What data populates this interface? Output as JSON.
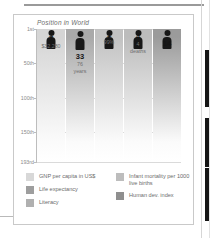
{
  "figure": {
    "title": "Position in World"
  },
  "chart_data": {
    "type": "bar",
    "title": "Position in World",
    "xlabel": "",
    "ylabel": "Position in World",
    "ylim": [
      1,
      193
    ],
    "grid": true,
    "legend_position": "bottom",
    "ytick_labels": [
      "1st",
      "50th",
      "100th",
      "150th",
      "193rd"
    ],
    "ytick_values": [
      1,
      50,
      100,
      150,
      193
    ],
    "categories": [
      "GNP per capita in US$",
      "Life expectancy",
      "Literacy",
      "Infant mortality per 1000 live births",
      "Human dev. index"
    ],
    "values": [
      7,
      33,
      1,
      4,
      14
    ],
    "annotations": [
      "$32,280",
      "76 years",
      "99%",
      "4 deaths",
      ""
    ],
    "bars": [
      {
        "rank": "7",
        "detail": "$32,280",
        "detail2": "",
        "shade": "#d5d5d5"
      },
      {
        "rank": "33",
        "detail": "76",
        "detail2": "years",
        "shade": "#a9a9a9"
      },
      {
        "rank": "1",
        "detail": "99%",
        "detail2": "",
        "shade": "#c2c2c2"
      },
      {
        "rank": "4",
        "detail": "4",
        "detail2": "deaths",
        "shade": "#bcbcbc"
      },
      {
        "rank": "14",
        "detail": "",
        "detail2": "",
        "shade": "#9b9b9b"
      }
    ]
  },
  "legend": {
    "left": [
      {
        "label": "GNP per capita in US$",
        "color": "#d8d8d8"
      },
      {
        "label": "Life expectancy",
        "color": "#9e9e9e"
      },
      {
        "label": "Literacy",
        "color": "#b0b0b0"
      }
    ],
    "right": [
      {
        "label": "Infant mortality per 1000 live births",
        "color": "#bdbdbd"
      },
      {
        "label": "Human dev. index",
        "color": "#8f8f8f"
      }
    ]
  }
}
